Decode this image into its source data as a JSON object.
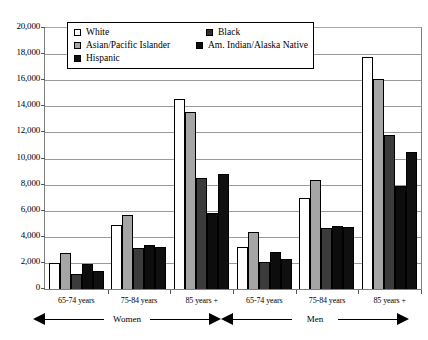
{
  "chart_data": {
    "type": "bar",
    "title": "",
    "subtitle": "",
    "xlabel": "",
    "ylabel": "",
    "ylim": [
      0,
      20000
    ],
    "ytick_step": 2000,
    "grid": true,
    "legend_position": "top-center-inside",
    "categories": [
      "65-74 years",
      "75-84 years",
      "85 years +",
      "65-74 years",
      "75-84 years",
      "85 years +"
    ],
    "panel_groups": [
      {
        "label": "Women",
        "categories": [
          "65-74 years",
          "75-84 years",
          "85 years +"
        ]
      },
      {
        "label": "Men",
        "categories": [
          "65-74 years",
          "75-84 years",
          "85 years +"
        ]
      }
    ],
    "ytick_labels": [
      "20,000",
      "18,000",
      "16,000",
      "14,000",
      "12,000",
      "10,000",
      "8,000",
      "6,000",
      "4,000",
      "2,000",
      "0"
    ],
    "ytick_values": [
      20000,
      18000,
      16000,
      14000,
      12000,
      10000,
      8000,
      6000,
      4000,
      2000,
      0
    ],
    "series": [
      {
        "name": "White",
        "key": "white",
        "color": "#ffffff",
        "values": [
          2000,
          4900,
          14600,
          3250,
          7000,
          17800
        ]
      },
      {
        "name": "Black",
        "key": "black",
        "color": "#2e2e2e",
        "values": [
          1150,
          3150,
          8500,
          2100,
          4700,
          11800
        ]
      },
      {
        "name": "Asian/Pacific Islander",
        "key": "asian",
        "color": "#a5a5a5",
        "values": [
          2800,
          5650,
          13600,
          4350,
          8350,
          16100
        ]
      },
      {
        "name": "Am. Indian/Alaska Native",
        "key": "amind",
        "color": "#0d0d0d",
        "values": [
          1900,
          3400,
          5800,
          2850,
          4800,
          7900
        ]
      },
      {
        "name": "Hispanic",
        "key": "hisp",
        "color": "#101010",
        "values": [
          1350,
          3250,
          8800,
          2300,
          4750,
          10500
        ]
      }
    ],
    "bar_order": [
      "white",
      "asian",
      "black",
      "amind",
      "hisp"
    ]
  },
  "legend": {
    "rows": [
      [
        {
          "label": "White",
          "key": "white"
        },
        {
          "label": "Black",
          "key": "black"
        }
      ],
      [
        {
          "label": "Asian/Pacific Islander",
          "key": "asian"
        },
        {
          "label": "Am. Indian/Alaska Native",
          "key": "amind"
        }
      ],
      [
        {
          "label": "Hispanic",
          "key": "hisp"
        }
      ]
    ]
  }
}
